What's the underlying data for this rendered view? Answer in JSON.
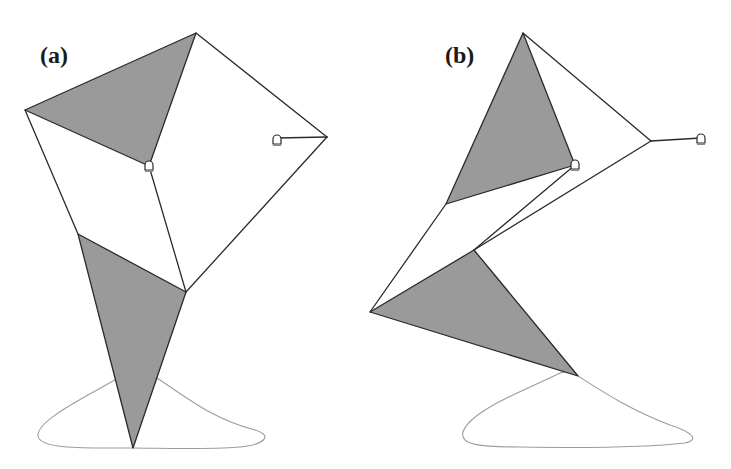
{
  "figure": {
    "panels": [
      {
        "id": "a",
        "label": "(a)",
        "label_pos": [
          40,
          63
        ],
        "shaded_triangles": [
          [
            [
              25,
              110
            ],
            [
              196,
              33
            ],
            [
              149,
              166
            ]
          ],
          [
            [
              78,
              234
            ],
            [
              186,
              292
            ],
            [
              133,
              448
            ]
          ]
        ],
        "edges": [
          [
            [
              25,
              110
            ],
            [
              78,
              234
            ]
          ],
          [
            [
              149,
              166
            ],
            [
              186,
              292
            ]
          ],
          [
            [
              196,
              33
            ],
            [
              327,
              137
            ]
          ],
          [
            [
              327,
              137
            ],
            [
              186,
              292
            ]
          ],
          [
            [
              327,
              137
            ],
            [
              277,
              138
            ]
          ]
        ],
        "anchors": [
          {
            "name": "pivot-anchor",
            "pos": [
              149,
              166
            ]
          },
          {
            "name": "ground-anchor",
            "pos": [
              277,
              140
            ]
          }
        ],
        "trajectory_curve": "M 133 448 C 90 448, 40 450, 38 436 C 36 420, 90 395, 118 378 C 130 371, 145 372, 157 378 C 190 400, 215 420, 255 430 C 275 436, 262 445, 240 447 C 200 450, 160 448, 133 448 Z"
      },
      {
        "id": "b",
        "label": "(b)",
        "label_pos": [
          445,
          63
        ],
        "shaded_triangles": [
          [
            [
              446,
              204
            ],
            [
              523,
              33
            ],
            [
              575,
              165
            ]
          ],
          [
            [
              370,
              312
            ],
            [
              474,
              250
            ],
            [
              578,
              376
            ]
          ]
        ],
        "edges": [
          [
            [
              446,
              204
            ],
            [
              370,
              312
            ]
          ],
          [
            [
              575,
              165
            ],
            [
              474,
              250
            ]
          ],
          [
            [
              523,
              33
            ],
            [
              651,
              141
            ]
          ],
          [
            [
              651,
              141
            ],
            [
              474,
              250
            ]
          ],
          [
            [
              651,
              141
            ],
            [
              701,
              138
            ]
          ]
        ],
        "anchors": [
          {
            "name": "pivot-anchor",
            "pos": [
              575,
              165
            ]
          },
          {
            "name": "ground-anchor",
            "pos": [
              701,
              139
            ]
          }
        ],
        "trajectory_curve": "M 558 374 C 530 388, 470 410, 463 432 C 460 445, 480 447, 520 447 C 580 448, 650 447, 685 443 C 700 440, 692 432, 670 425 C 630 410, 600 390, 578 376 C 570 371, 563 371, 558 374 Z"
      }
    ],
    "colors": {
      "shaded_fill": "#9a9a9a",
      "edge": "#2a2a2a",
      "curve": "#9c9c9c",
      "background": "#ffffff"
    }
  }
}
